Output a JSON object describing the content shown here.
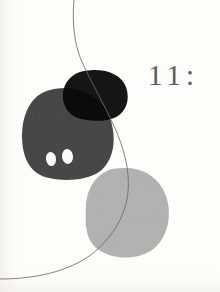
{
  "page": {
    "width": 220,
    "height": 292,
    "background_color": "#fdfdfc",
    "paper_tint": "#faf9f7"
  },
  "page_number": {
    "text": "11:",
    "color": "#5a5a5a",
    "font_size_px": 29
  },
  "artwork": {
    "title": "",
    "palette": {
      "paper": "#fdfdfc",
      "dark_gray_blob": "#4a4a4a",
      "black_blob": "#141414",
      "overlap": "#0b0b0b",
      "light_gray_blob": "#b5b5b5",
      "ink_line": "#6b6b6b",
      "hole": "#fbfbfa",
      "edge_shadow": "#ececea"
    },
    "shapes": [
      {
        "name": "dark-gray-blob",
        "kind": "organic-blob",
        "fill": "#4a4a4a",
        "bounds": {
          "x": 22,
          "y": 88,
          "w": 90,
          "h": 92
        }
      },
      {
        "name": "black-blob",
        "kind": "organic-blob",
        "fill": "#141414",
        "bounds": {
          "x": 62,
          "y": 70,
          "w": 66,
          "h": 50
        }
      },
      {
        "name": "blob-overlap-region",
        "kind": "intersection",
        "fill": "#0b0b0b",
        "bounds": {
          "x": 62,
          "y": 88,
          "w": 50,
          "h": 32
        }
      },
      {
        "name": "light-gray-blob",
        "kind": "organic-blob",
        "fill": "#b5b5b5",
        "bounds": {
          "x": 85,
          "y": 168,
          "w": 83,
          "h": 90
        }
      },
      {
        "name": "left-eye-hole",
        "kind": "oval-cutout",
        "fill": "#fbfbfa",
        "bounds": {
          "x": 46,
          "y": 152,
          "w": 10,
          "h": 14
        }
      },
      {
        "name": "right-eye-hole",
        "kind": "oval-cutout",
        "fill": "#fbfbfa",
        "bounds": {
          "x": 62,
          "y": 149,
          "w": 11,
          "h": 15
        }
      },
      {
        "name": "ink-curve",
        "kind": "thin-line",
        "stroke": "#6b6b6b",
        "stroke_width": 0.9,
        "from": {
          "x": 74,
          "y": 0
        },
        "to": {
          "x": 0,
          "y": 279
        }
      }
    ]
  }
}
